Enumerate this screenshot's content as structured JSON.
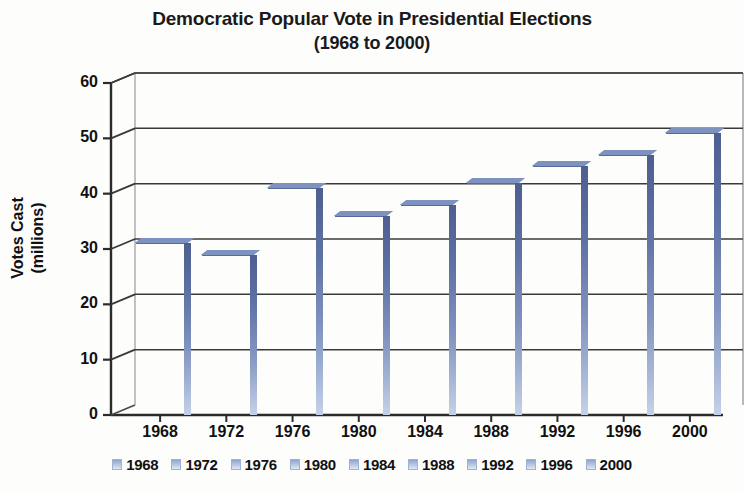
{
  "chart_data": {
    "type": "bar",
    "title": "Democratic Popular Vote in Presidential Elections",
    "subtitle": "(1968 to 2000)",
    "xlabel": "",
    "ylabel": "Votes Cast (millions)",
    "ylabel_lines": [
      "Votes Cast",
      "(millions)"
    ],
    "categories": [
      "1968",
      "1972",
      "1976",
      "1980",
      "1984",
      "1988",
      "1992",
      "1996",
      "2000"
    ],
    "values": [
      31,
      29,
      41,
      36,
      38,
      42,
      45,
      47,
      51
    ],
    "ylim": [
      0,
      60
    ],
    "ytick_labels": [
      "0",
      "10",
      "20",
      "30",
      "40",
      "50",
      "60"
    ],
    "ytick_values": [
      0,
      10,
      20,
      30,
      40,
      50,
      60
    ],
    "grid": true,
    "grid_axis": "y",
    "legend_position": "bottom",
    "legend_entries": [
      "1968",
      "1972",
      "1976",
      "1980",
      "1984",
      "1988",
      "1992",
      "1996",
      "2000"
    ],
    "style": "3d-column",
    "colors": {
      "bar_top": "#6b82b8",
      "bar_bottom": "#e3ecf8",
      "bar_side": "#4d5f8f",
      "axis": "#2b2b2b",
      "grid": "#3a3a3a",
      "text": "#111111",
      "background": "#fdfdfc"
    }
  }
}
